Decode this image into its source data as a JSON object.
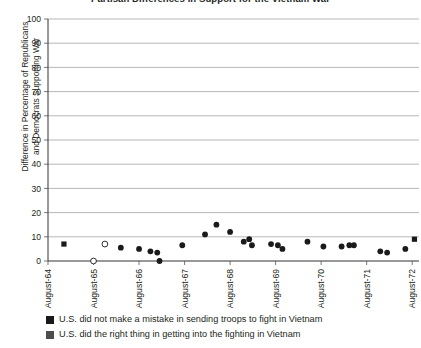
{
  "chart_data": {
    "type": "scatter",
    "title": "Partisan Differences in Support for the Vietnam War",
    "xlabel": "",
    "ylabel": "Difference in Percentage of Republicans and Democrats Supporting War",
    "ylabel_line1": "Difference in Percentage of Republicans",
    "ylabel_line2": "and Democrats Supporting War",
    "ylim": [
      0,
      100
    ],
    "yticks": [
      0,
      10,
      20,
      30,
      40,
      50,
      60,
      70,
      80,
      90,
      100
    ],
    "xlim": [
      "August-64",
      "August-72"
    ],
    "xticks": [
      "August-64",
      "August-65",
      "August-66",
      "August-67",
      "August-68",
      "August-69",
      "August-70",
      "August-71",
      "August-72"
    ],
    "grid": "horizontal",
    "legend_position": "below-axis",
    "marker_color_series1": "#1a1a1a",
    "marker_color_series2": "#555555",
    "series": [
      {
        "name": "U.S. did not make a mistake in sending troops to fight in Vietnam",
        "marker": "square-filled",
        "color": "#1a1a1a",
        "points": [
          {
            "x": 64.35,
            "y": 7.0
          },
          {
            "x": 72.05,
            "y": 9.0
          }
        ]
      },
      {
        "name": "U.S. did the right thing in getting into the fighting in Vietnam",
        "marker": "circle",
        "color": "#1a1a1a",
        "points": [
          {
            "x": 65.0,
            "y": 0.0,
            "filled": false
          },
          {
            "x": 65.25,
            "y": 7.0,
            "filled": false
          },
          {
            "x": 65.6,
            "y": 5.5,
            "filled": true
          },
          {
            "x": 66.0,
            "y": 5.0,
            "filled": true
          },
          {
            "x": 66.25,
            "y": 4.0,
            "filled": true
          },
          {
            "x": 66.4,
            "y": 3.5,
            "filled": true
          },
          {
            "x": 66.45,
            "y": 0.0,
            "filled": true
          },
          {
            "x": 66.95,
            "y": 6.5,
            "filled": true
          },
          {
            "x": 67.45,
            "y": 11.0,
            "filled": true
          },
          {
            "x": 67.7,
            "y": 15.0,
            "filled": true
          },
          {
            "x": 68.0,
            "y": 12.0,
            "filled": true
          },
          {
            "x": 68.3,
            "y": 8.0,
            "filled": true
          },
          {
            "x": 68.42,
            "y": 9.0,
            "filled": true
          },
          {
            "x": 68.48,
            "y": 6.5,
            "filled": true
          },
          {
            "x": 68.9,
            "y": 7.0,
            "filled": true
          },
          {
            "x": 69.05,
            "y": 6.5,
            "filled": true
          },
          {
            "x": 69.15,
            "y": 5.0,
            "filled": true
          },
          {
            "x": 69.7,
            "y": 8.0,
            "filled": true
          },
          {
            "x": 70.05,
            "y": 6.0,
            "filled": true
          },
          {
            "x": 70.45,
            "y": 6.0,
            "filled": true
          },
          {
            "x": 70.62,
            "y": 6.5,
            "filled": true
          },
          {
            "x": 70.72,
            "y": 6.5,
            "filled": true
          },
          {
            "x": 71.3,
            "y": 4.0,
            "filled": true
          },
          {
            "x": 71.45,
            "y": 3.5,
            "filled": true
          },
          {
            "x": 71.85,
            "y": 5.0,
            "filled": true
          }
        ]
      }
    ]
  },
  "legend": {
    "items": [
      {
        "label": "U.S. did not make a mistake in sending troops to fight in Vietnam",
        "color": "#1a1a1a"
      },
      {
        "label": "U.S. did the right thing in getting into the fighting in Vietnam",
        "color": "#4d4d4d"
      }
    ]
  }
}
